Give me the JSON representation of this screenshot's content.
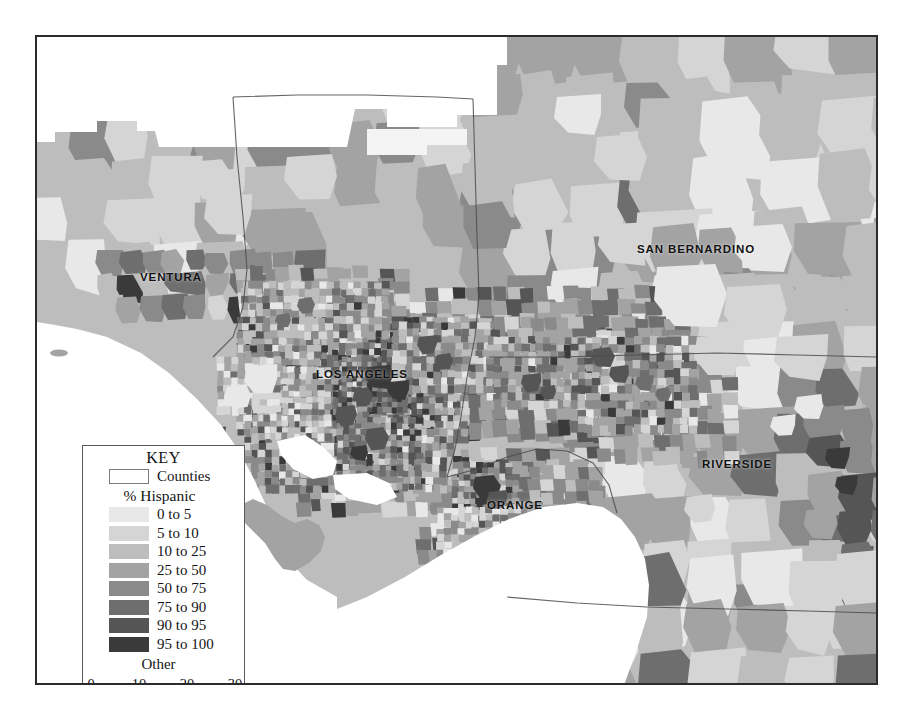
{
  "map": {
    "title": "Percent Hispanic by Census Tract — Southern California",
    "county_labels": [
      {
        "name": "VENTURA",
        "text": "VENTURA",
        "x": 103,
        "y": 234
      },
      {
        "name": "SAN BERNARDINO",
        "text": "SAN BERNARDINO",
        "x": 600,
        "y": 206
      },
      {
        "name": "LOS ANGELES",
        "text": "LOS ANGELES",
        "x": 279,
        "y": 331
      },
      {
        "name": "RIVERSIDE",
        "text": "RIVERSIDE",
        "x": 665,
        "y": 421
      },
      {
        "name": "ORANGE",
        "text": "ORANGE",
        "x": 450,
        "y": 462
      }
    ],
    "ocean_color": "#ffffff",
    "outside_color": "#ffffff",
    "boundary_color": "#4a4a4a",
    "frame_color": "#2b2b2b"
  },
  "legend": {
    "title": "KEY",
    "counties_label": "Counties",
    "subtitle": "% Hispanic",
    "other_label": "Other",
    "classes": [
      {
        "label": "0 to 5",
        "color": "#e8e8e8"
      },
      {
        "label": "5 to 10",
        "color": "#d5d5d5"
      },
      {
        "label": "10 to 25",
        "color": "#bdbdbd"
      },
      {
        "label": "25 to 50",
        "color": "#a3a3a3"
      },
      {
        "label": "50 to 75",
        "color": "#8a8a8a"
      },
      {
        "label": "75 to 90",
        "color": "#6e6e6e"
      },
      {
        "label": "90 to 95",
        "color": "#555555"
      },
      {
        "label": "95 to 100",
        "color": "#3a3a3a"
      }
    ],
    "scalebar": {
      "ticks": [
        "0",
        "10",
        "20",
        "30"
      ],
      "unit": "Miles",
      "segments": [
        "dark",
        "light",
        "dark"
      ]
    }
  },
  "chart_data": {
    "type": "map",
    "title": "% Hispanic",
    "categories": [
      "0 to 5",
      "5 to 10",
      "10 to 25",
      "25 to 50",
      "50 to 75",
      "75 to 90",
      "90 to 95",
      "95 to 100"
    ],
    "colors": [
      "#e8e8e8",
      "#d5d5d5",
      "#bdbdbd",
      "#a3a3a3",
      "#8a8a8a",
      "#6e6e6e",
      "#555555",
      "#3a3a3a"
    ],
    "regions": [
      "VENTURA",
      "LOS ANGELES",
      "SAN BERNARDINO",
      "RIVERSIDE",
      "ORANGE"
    ],
    "legend_position": "bottom-left",
    "scale_ticks": [
      0,
      10,
      20,
      30
    ],
    "scale_unit": "Miles"
  }
}
